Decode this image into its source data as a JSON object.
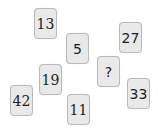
{
  "puzzle": {
    "tiles": [
      {
        "id": "t13",
        "value": "13",
        "x": 34,
        "y": 8,
        "font": "serif"
      },
      {
        "id": "t5",
        "value": "5",
        "x": 66,
        "y": 33,
        "font": "sans"
      },
      {
        "id": "t27",
        "value": "27",
        "x": 119,
        "y": 22,
        "font": "sans"
      },
      {
        "id": "tq",
        "value": "?",
        "x": 97,
        "y": 56,
        "font": "sans"
      },
      {
        "id": "t19",
        "value": "19",
        "x": 39,
        "y": 64,
        "font": "serif"
      },
      {
        "id": "t42",
        "value": "42",
        "x": 10,
        "y": 85,
        "font": "serif"
      },
      {
        "id": "t33",
        "value": "33",
        "x": 127,
        "y": 78,
        "font": "sans"
      },
      {
        "id": "t11",
        "value": "11",
        "x": 67,
        "y": 94,
        "font": "serif"
      }
    ],
    "colors": {
      "tile_fill": "#e9e9e9",
      "tile_border": "#b9b9b9",
      "text": "#1e1e1e",
      "background": "#ffffff"
    }
  }
}
